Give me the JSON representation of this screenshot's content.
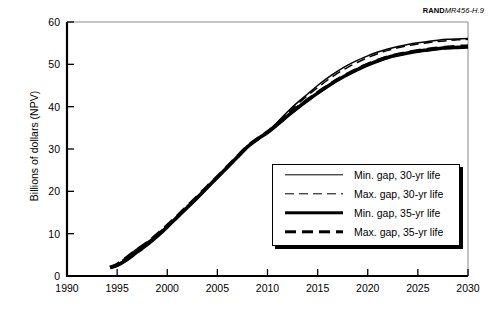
{
  "credit": {
    "brand": "RAND",
    "code": "MR456-H.9"
  },
  "chart_data": {
    "type": "line",
    "title": "",
    "xlabel": "",
    "ylabel": "Billions of dollars (NPV)",
    "xlim": [
      1990,
      2030
    ],
    "ylim": [
      0,
      60
    ],
    "xticks": [
      1990,
      1995,
      2000,
      2005,
      2010,
      2015,
      2020,
      2025,
      2030
    ],
    "yticks": [
      0,
      10,
      20,
      30,
      40,
      50,
      60
    ],
    "grid": false,
    "legend_position": "inside-lower-right",
    "series": [
      {
        "name": "Min. gap, 30-yr life",
        "style": "thin-solid",
        "x": [
          1994.3,
          1995,
          1996,
          1997,
          1998,
          1999,
          2000,
          2001,
          2002,
          2003,
          2004,
          2005,
          2006,
          2007,
          2008,
          2009,
          2010,
          2011,
          2012,
          2013,
          2014,
          2015,
          2016,
          2017,
          2018,
          2019,
          2020,
          2021,
          2022,
          2023,
          2024,
          2025,
          2026,
          2027,
          2028,
          2029,
          2030
        ],
        "y": [
          2.0,
          2.6,
          4.2,
          6.0,
          7.6,
          9.6,
          11.8,
          14.0,
          16.3,
          18.6,
          21.0,
          23.4,
          25.8,
          28.2,
          30.6,
          32.4,
          34.0,
          36.4,
          38.8,
          41.0,
          43.0,
          45.0,
          46.8,
          48.4,
          49.8,
          51.0,
          52.0,
          52.9,
          53.6,
          54.2,
          54.7,
          55.1,
          55.4,
          55.7,
          55.9,
          56.0,
          56.1
        ]
      },
      {
        "name": "Max. gap, 30-yr life",
        "style": "thin-dash",
        "x": [
          1994.3,
          1995,
          1996,
          1997,
          1998,
          1999,
          2000,
          2001,
          2002,
          2003,
          2004,
          2005,
          2006,
          2007,
          2008,
          2009,
          2010,
          2011,
          2012,
          2013,
          2014,
          2015,
          2016,
          2017,
          2018,
          2019,
          2020,
          2021,
          2022,
          2023,
          2024,
          2025,
          2026,
          2027,
          2028,
          2029,
          2030
        ],
        "y": [
          2.0,
          2.8,
          4.6,
          6.4,
          8.0,
          9.9,
          12.0,
          14.2,
          16.5,
          18.8,
          21.2,
          23.5,
          25.9,
          28.3,
          30.7,
          32.5,
          34.1,
          36.3,
          38.5,
          40.6,
          42.6,
          44.5,
          46.3,
          47.9,
          49.3,
          50.5,
          51.6,
          52.5,
          53.3,
          53.9,
          54.4,
          54.8,
          55.1,
          55.4,
          55.6,
          55.8,
          55.9
        ]
      },
      {
        "name": "Min. gap, 35-yr life",
        "style": "thick-solid",
        "x": [
          1994.3,
          1995,
          1996,
          1997,
          1998,
          1999,
          2000,
          2001,
          2002,
          2003,
          2004,
          2005,
          2006,
          2007,
          2008,
          2009,
          2010,
          2011,
          2012,
          2013,
          2014,
          2015,
          2016,
          2017,
          2018,
          2019,
          2020,
          2021,
          2022,
          2023,
          2024,
          2025,
          2026,
          2027,
          2028,
          2029,
          2030
        ],
        "y": [
          2.0,
          2.5,
          3.9,
          5.7,
          7.4,
          9.4,
          11.6,
          13.9,
          16.2,
          18.5,
          20.9,
          23.3,
          25.7,
          28.1,
          30.5,
          32.3,
          33.9,
          35.8,
          37.8,
          39.7,
          41.5,
          43.2,
          44.8,
          46.3,
          47.6,
          48.8,
          49.9,
          50.8,
          51.6,
          52.2,
          52.7,
          53.1,
          53.4,
          53.7,
          53.9,
          54.0,
          54.1
        ]
      },
      {
        "name": "Max. gap, 35-yr life",
        "style": "thick-dash",
        "x": [
          1994.3,
          1995,
          1996,
          1997,
          1998,
          1999,
          2000,
          2001,
          2002,
          2003,
          2004,
          2005,
          2006,
          2007,
          2008,
          2009,
          2010,
          2011,
          2012,
          2013,
          2014,
          2015,
          2016,
          2017,
          2018,
          2019,
          2020,
          2021,
          2022,
          2023,
          2024,
          2025,
          2026,
          2027,
          2028,
          2029,
          2030
        ],
        "y": [
          2.0,
          2.7,
          4.4,
          6.2,
          7.8,
          9.8,
          11.9,
          14.1,
          16.4,
          18.7,
          21.1,
          23.4,
          25.8,
          28.2,
          30.6,
          32.4,
          34.0,
          35.9,
          37.9,
          39.8,
          41.6,
          43.3,
          44.9,
          46.4,
          47.7,
          48.9,
          50.0,
          50.9,
          51.7,
          52.3,
          52.8,
          53.2,
          53.5,
          53.8,
          54.0,
          54.2,
          54.3
        ]
      }
    ]
  },
  "legend": {
    "entries": [
      {
        "label": "Min. gap, 30-yr life",
        "style": "thin-solid"
      },
      {
        "label": "Max. gap, 30-yr life",
        "style": "thin-dash"
      },
      {
        "label": "Min. gap, 35-yr life",
        "style": "thick-solid"
      },
      {
        "label": "Max. gap, 35-yr life",
        "style": "thick-dash"
      }
    ]
  }
}
